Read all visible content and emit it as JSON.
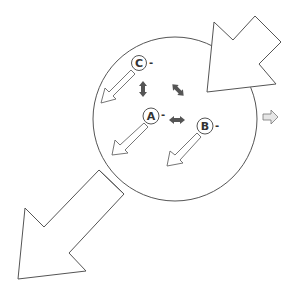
{
  "diagram": {
    "type": "particle-cell-schematic",
    "colors": {
      "stroke": "#555555",
      "fill": "#ffffff",
      "double_arrow": "#555555",
      "small_arrow_fill": "#e6e6e6"
    },
    "cell": {
      "cx": 175,
      "cy": 119,
      "r": 82
    },
    "particles": [
      {
        "id": "C",
        "label": "C",
        "charge": "-",
        "cx": 139,
        "cy": 63
      },
      {
        "id": "A",
        "label": "A",
        "charge": "-",
        "cx": 151,
        "cy": 116
      },
      {
        "id": "B",
        "label": "B",
        "charge": "-",
        "cx": 205,
        "cy": 126
      }
    ],
    "interactions": [
      {
        "between": [
          "C",
          "A"
        ],
        "orientation": "vertical"
      },
      {
        "between": [
          "C",
          "B"
        ],
        "orientation": "diagonal"
      },
      {
        "between": [
          "A",
          "B"
        ],
        "orientation": "horizontal"
      }
    ],
    "arrows": {
      "inflow": "large hollow arrow entering from top-right",
      "outflow": "large hollow arrow exiting to bottom-left",
      "efflux": "small hollow arrow pointing right outside cell"
    }
  }
}
